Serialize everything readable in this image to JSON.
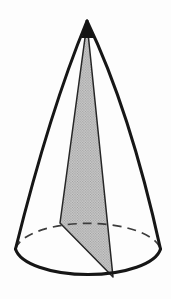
{
  "figure": {
    "canvas": {
      "width": 171,
      "height": 299,
      "background": "#fdfdfd"
    },
    "colors": {
      "outline": "#161616",
      "dashed_line": "#3c3c3c",
      "triangle_edge": "#262626",
      "shade_base": "#c8c8c8",
      "shade_dot": "#8a8a8a",
      "apex_fill": "#141414"
    },
    "apex": {
      "x": 87,
      "y": 21
    },
    "base_ellipse": {
      "cx": 88,
      "cy": 252,
      "rx": 73,
      "ry": 29,
      "tangent_left": {
        "x": 15.5,
        "y": 249
      },
      "tangent_right": {
        "x": 160.5,
        "y": 249
      }
    },
    "side_curves": {
      "left_control": {
        "x": 50,
        "y": 110
      },
      "right_control": {
        "x": 130,
        "y": 110
      }
    },
    "cross_section": {
      "apex": {
        "x": 87,
        "y": 23
      },
      "back_vertex": {
        "x": 60,
        "y": 223
      },
      "front_vertex": {
        "x": 113,
        "y": 277
      }
    },
    "stroke_widths": {
      "outline": 3,
      "dashed": 1.7,
      "triangle": 1.5
    },
    "dash_pattern": "9 6",
    "apex_wedge": {
      "half_width_left": 5.5,
      "half_width_right": 6.5,
      "depth": 17
    }
  }
}
